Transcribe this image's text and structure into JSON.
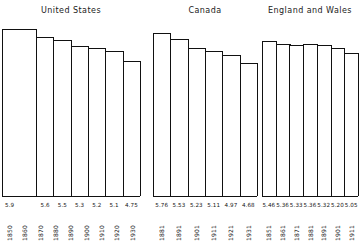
{
  "figure": {
    "background_color": "#ffffff",
    "line_color": "#111111"
  },
  "panels": [
    {
      "key": "united_states",
      "title": "United States",
      "bars": [
        {
          "value": "5.9",
          "height": 5.9,
          "wide": true
        },
        {
          "value": "5.6",
          "height": 5.6,
          "wide": false
        },
        {
          "value": "5.5",
          "height": 5.5,
          "wide": false
        },
        {
          "value": "5.3",
          "height": 5.3,
          "wide": false
        },
        {
          "value": "5.2",
          "height": 5.2,
          "wide": false
        },
        {
          "value": "5.1",
          "height": 5.1,
          "wide": false
        },
        {
          "value": "4.75",
          "height": 4.75,
          "wide": false
        }
      ],
      "years": [
        "1850",
        "1860",
        "1870",
        "1880",
        "1890",
        "1900",
        "1910",
        "1920",
        "1930"
      ]
    },
    {
      "key": "canada",
      "title": "Canada",
      "bars": [
        {
          "value": "5.76",
          "height": 5.76,
          "wide": false
        },
        {
          "value": "5.53",
          "height": 5.53,
          "wide": false
        },
        {
          "value": "5.23",
          "height": 5.23,
          "wide": false
        },
        {
          "value": "5.11",
          "height": 5.11,
          "wide": false
        },
        {
          "value": "4.97",
          "height": 4.97,
          "wide": false
        },
        {
          "value": "4.68",
          "height": 4.68,
          "wide": false
        }
      ],
      "years": [
        "1881",
        "1891",
        "1901",
        "1911",
        "1921",
        "1931"
      ]
    },
    {
      "key": "england_and_wales",
      "title": "England and Wales",
      "bars": [
        {
          "value": "5.46",
          "height": 5.46,
          "wide": false
        },
        {
          "value": "5.36",
          "height": 5.36,
          "wide": false
        },
        {
          "value": "5.33",
          "height": 5.33,
          "wide": false
        },
        {
          "value": "5.36",
          "height": 5.36,
          "wide": false
        },
        {
          "value": "5.32",
          "height": 5.32,
          "wide": false
        },
        {
          "value": "5.20",
          "height": 5.2,
          "wide": false
        },
        {
          "value": "5.05",
          "height": 5.05,
          "wide": false
        }
      ],
      "years": [
        "1851",
        "1861",
        "1871",
        "1881",
        "1891",
        "1901",
        "1911"
      ]
    }
  ],
  "chart_data": {
    "type": "bar",
    "title": "",
    "xlabel": "",
    "ylabel": "",
    "ylim": [
      0,
      6.2
    ],
    "grid": false,
    "legend": "none",
    "note": "Three side-by-side bar panels; bar tops encode the printed value, bars are outlined (unfilled) and share a common baseline.",
    "panels": [
      {
        "name": "United States",
        "categories": [
          "1850-1870",
          "1880",
          "1890",
          "1900",
          "1910",
          "1920",
          "1930"
        ],
        "tick_labels": [
          "1850",
          "1860",
          "1870",
          "1880",
          "1890",
          "1900",
          "1910",
          "1920",
          "1930"
        ],
        "values": [
          5.9,
          5.6,
          5.5,
          5.3,
          5.2,
          5.1,
          4.75
        ]
      },
      {
        "name": "Canada",
        "categories": [
          "1881",
          "1891",
          "1901",
          "1911",
          "1921",
          "1931"
        ],
        "tick_labels": [
          "1881",
          "1891",
          "1901",
          "1911",
          "1921",
          "1931"
        ],
        "values": [
          5.76,
          5.53,
          5.23,
          5.11,
          4.97,
          4.68
        ]
      },
      {
        "name": "England and Wales",
        "categories": [
          "1851",
          "1861",
          "1871",
          "1881",
          "1891",
          "1901",
          "1911"
        ],
        "tick_labels": [
          "1851",
          "1861",
          "1871",
          "1881",
          "1891",
          "1901",
          "1911"
        ],
        "values": [
          5.46,
          5.36,
          5.33,
          5.36,
          5.32,
          5.2,
          5.05
        ]
      }
    ]
  }
}
